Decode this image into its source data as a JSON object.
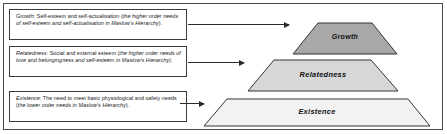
{
  "diagram": {
    "title_visible": false,
    "colors": {
      "frame_border": "#4a4a4a",
      "box_border": "#3c3c3c",
      "arrow": "#2b2b2b",
      "tier_growth_fill": "#a8a8a8",
      "tier_relatedness_fill": "#d7d7d7",
      "tier_existence_fill": "#f2f2f2",
      "tier_stroke": "#333333",
      "text": "#1a1a1a"
    },
    "descriptions": [
      {
        "id": "growth",
        "term": "Growth:",
        "body": " Self-esteem and self-actualisation (",
        "emphasis": "the higher order needs of self-esteem and self-actualisation in Maslow's Hierarchy",
        "tail": ")."
      },
      {
        "id": "relatedness",
        "term": "Relatedness:",
        "body": " Social and external esteem (",
        "emphasis": "the higher order needs of love and belongingness and self-esteem in Maslow's Hierarchy",
        "tail": ")."
      },
      {
        "id": "existence",
        "term": "Existence:",
        "body": " The need to meet basic physiological and safety needs (",
        "emphasis": "the lower order needs in Maslow's Hierarchy",
        "tail": ")."
      }
    ],
    "pyramid": {
      "orientation": "apex-top",
      "tiers": [
        {
          "id": "growth",
          "label": "Growth",
          "level": 3,
          "fill": "#a8a8a8"
        },
        {
          "id": "relatedness",
          "label": "Relatedness",
          "level": 2,
          "fill": "#d7d7d7"
        },
        {
          "id": "existence",
          "label": "Existence",
          "level": 1,
          "fill": "#f2f2f2"
        }
      ]
    },
    "connectors": [
      {
        "id": "arrow-growth",
        "from": "box-growth",
        "to": "tier-growth",
        "direction": "right"
      },
      {
        "id": "arrow-relatedness",
        "from": "box-relatedness",
        "to": "tier-relatedness",
        "direction": "right"
      },
      {
        "id": "arrow-existence",
        "from": "box-existence",
        "to": "tier-existence",
        "direction": "right"
      }
    ]
  }
}
